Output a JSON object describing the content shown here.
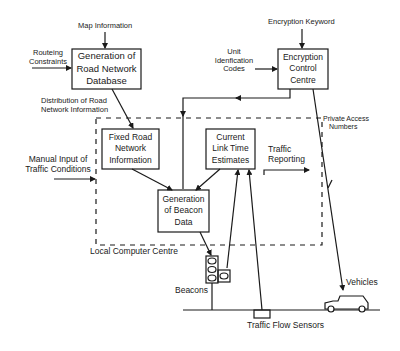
{
  "diagram": {
    "type": "flow-diagram",
    "boxes": {
      "road_network_db": {
        "label_lines": [
          "Generation of",
          "Road Network",
          "Database"
        ]
      },
      "fixed_road_info": {
        "label_lines": [
          "Fixed Road",
          "Network",
          "Information"
        ]
      },
      "link_time": {
        "label_lines": [
          "Current",
          "Link Time",
          "Estimates"
        ]
      },
      "beacon_data": {
        "label_lines": [
          "Generation",
          "of Beacon",
          "Data"
        ]
      },
      "encryption_centre": {
        "label_lines": [
          "Encryption",
          "Control",
          "Centre"
        ]
      }
    },
    "inputs": {
      "map_information": "Map Information",
      "routeing_constraints": [
        "Routeing",
        "Constraints"
      ],
      "encryption_keyword": "Encryption Keyword",
      "unit_identification": [
        "Unit",
        "Idenfication",
        "Codes"
      ],
      "manual_input": [
        "Manual Input of",
        "Traffic Conditions"
      ]
    },
    "flows": {
      "distribution": [
        "Distribution of Road",
        "Network Information"
      ],
      "traffic_reporting": [
        "Traffic",
        "Reporting"
      ],
      "private_access": [
        "Private Access",
        "Numbers"
      ]
    },
    "regions": {
      "local_computer_centre": "Local Computer Centre"
    },
    "field": {
      "beacons": "Beacons",
      "vehicles": "Vehicles",
      "traffic_flow_sensors": "Traffic Flow Sensors"
    },
    "colors": {
      "ink": "#1a1a1a",
      "background": "#ffffff"
    }
  }
}
